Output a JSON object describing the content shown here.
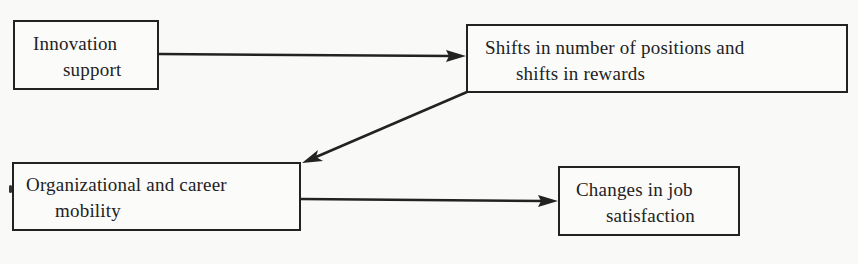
{
  "diagram": {
    "type": "flow",
    "nodes": [
      {
        "id": "innovation_support",
        "lines": [
          "Innovation",
          "support"
        ]
      },
      {
        "id": "shifts_positions_rewards",
        "lines": [
          "Shifts in number of positions and",
          "shifts in rewards"
        ]
      },
      {
        "id": "org_career_mobility",
        "lines": [
          "Organizational and career",
          "mobility"
        ]
      },
      {
        "id": "changes_job_satisfaction",
        "lines": [
          "Changes in job",
          "satisfaction"
        ]
      }
    ],
    "edges": [
      {
        "from": "innovation_support",
        "to": "shifts_positions_rewards"
      },
      {
        "from": "shifts_positions_rewards",
        "to": "org_career_mobility"
      },
      {
        "from": "org_career_mobility",
        "to": "changes_job_satisfaction"
      }
    ],
    "colors": {
      "stroke": "#222222",
      "background": "#f9f9f8",
      "text": "#222222"
    }
  }
}
